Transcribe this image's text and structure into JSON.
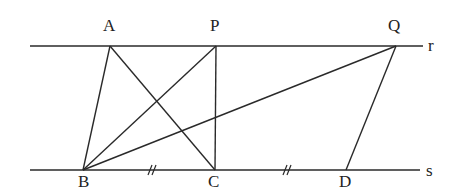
{
  "diagram": {
    "type": "geometry",
    "stroke_color": "#2a2a2a",
    "parallel_lines": [
      {
        "name": "r",
        "label": "r",
        "y": 46,
        "x1": 30,
        "x2": 423,
        "label_pos": [
          428,
          51
        ]
      },
      {
        "name": "s",
        "label": "s",
        "y": 170,
        "x1": 30,
        "x2": 420,
        "label_pos": [
          426,
          176
        ]
      }
    ],
    "points": {
      "A": {
        "label": "A",
        "x": 110,
        "y": 46,
        "label_pos": [
          103,
          31
        ]
      },
      "P": {
        "label": "P",
        "x": 216,
        "y": 46,
        "label_pos": [
          210,
          31
        ]
      },
      "Q": {
        "label": "Q",
        "x": 396,
        "y": 46,
        "label_pos": [
          388,
          31
        ]
      },
      "B": {
        "label": "B",
        "x": 83,
        "y": 170,
        "label_pos": [
          78,
          187
        ]
      },
      "C": {
        "label": "C",
        "x": 215,
        "y": 170,
        "label_pos": [
          208,
          187
        ]
      },
      "D": {
        "label": "D",
        "x": 346,
        "y": 170,
        "label_pos": [
          339,
          187
        ]
      }
    },
    "segments": [
      [
        "A",
        "B"
      ],
      [
        "A",
        "C"
      ],
      [
        "P",
        "B"
      ],
      [
        "P",
        "C"
      ],
      [
        "Q",
        "B"
      ],
      [
        "Q",
        "D"
      ]
    ],
    "equal_marks": [
      {
        "segment": [
          "B",
          "C"
        ],
        "x": 152,
        "y": 170,
        "mark": "//"
      },
      {
        "segment": [
          "C",
          "D"
        ],
        "x": 287,
        "y": 170,
        "mark": "//"
      }
    ]
  }
}
